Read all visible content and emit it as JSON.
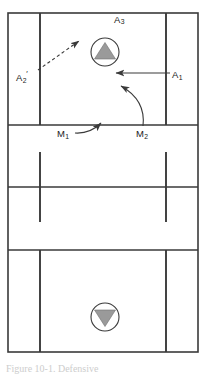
{
  "figure": {
    "type": "volleyball-court-diagram",
    "caption": "Figure 10-1. Defensive",
    "court": {
      "border_color": "#3a3a3a",
      "line_color": "#3a3a3a",
      "background": "#ffffff",
      "outer": {
        "x": 8,
        "y": 13,
        "width": 190,
        "height": 339
      },
      "sideline_left_x": 40,
      "sideline_right_x": 166,
      "horizontal_lines_y": [
        125,
        187,
        250
      ]
    },
    "players": [
      {
        "id": "player-top",
        "name": "setter-up-marker",
        "cx": 105,
        "cy": 52,
        "r": 14,
        "direction": "up",
        "fill": "#9a9a9a",
        "stroke": "#3a3a3a"
      },
      {
        "id": "player-bottom",
        "name": "setter-down-marker",
        "cx": 105,
        "cy": 317,
        "r": 14,
        "direction": "down",
        "fill": "#9a9a9a",
        "stroke": "#3a3a3a"
      }
    ],
    "labels": {
      "a3": {
        "text": "A",
        "sub": "3"
      },
      "a2": {
        "text": "A",
        "sub": "2",
        "prime": "′"
      },
      "a1": {
        "text": "A",
        "sub": "1"
      },
      "m1": {
        "text": "M",
        "sub": "1"
      },
      "m2": {
        "text": "M",
        "sub": "2"
      }
    },
    "arrows": [
      {
        "id": "arrow-a2",
        "name": "dashed-movement-arrow-a2",
        "style": "dashed",
        "from": [
          38,
          70
        ],
        "to": [
          79,
          41
        ],
        "color": "#3a3a3a"
      },
      {
        "id": "arrow-a1",
        "name": "straight-movement-arrow-a1",
        "style": "solid-straight",
        "from": [
          169,
          73
        ],
        "to": [
          117,
          73
        ],
        "color": "#3a3a3a"
      },
      {
        "id": "arrow-m1",
        "name": "curved-movement-arrow-m1",
        "style": "solid-curved",
        "from": [
          76,
          132
        ],
        "to": [
          103,
          122
        ],
        "color": "#3a3a3a"
      },
      {
        "id": "arrow-m2",
        "name": "curved-movement-arrow-m2",
        "style": "solid-curved",
        "from": [
          143,
          126
        ],
        "to": [
          120,
          85
        ],
        "color": "#3a3a3a"
      }
    ]
  }
}
